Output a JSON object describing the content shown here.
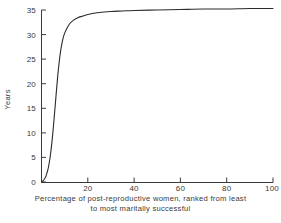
{
  "chart_data": {
    "type": "line",
    "title": "",
    "subtitle": "",
    "xlabel": "Percentage of post-reproductive women, ranked from least to most maritally successful",
    "xlabel_line1": "Percentage of  post-reproductive women, ranked from least",
    "xlabel_line2": "to most maritally successful",
    "ylabel": "Years",
    "xlim": [
      0,
      100
    ],
    "ylim": [
      0,
      35
    ],
    "xticks": [
      20,
      40,
      60,
      80,
      100
    ],
    "xtick_labels": [
      "20",
      "40",
      "60",
      "80",
      "100"
    ],
    "yticks": [
      0,
      5,
      10,
      15,
      20,
      25,
      30,
      35
    ],
    "ytick_labels": [
      "0",
      "5",
      "10",
      "15",
      "20",
      "25",
      "30",
      "35"
    ],
    "grid": false,
    "legend": "none",
    "line_color": "#2b2b2b",
    "line_width": 1.1,
    "background": "#ffffff",
    "series": [
      {
        "name": "Years",
        "x": [
          0,
          1,
          2,
          3,
          4,
          5,
          6,
          7,
          8,
          9,
          10,
          12,
          14,
          16,
          18,
          20,
          25,
          30,
          35,
          40,
          50,
          60,
          70,
          80,
          90,
          100
        ],
        "values": [
          0.0,
          0.4,
          1.3,
          3.0,
          6.0,
          10.5,
          16.0,
          21.5,
          25.8,
          28.6,
          30.3,
          32.1,
          33.0,
          33.5,
          33.8,
          34.1,
          34.5,
          34.7,
          34.8,
          34.9,
          35.0,
          35.1,
          35.2,
          35.2,
          35.3,
          35.3
        ]
      }
    ],
    "annotations": []
  },
  "axes": {
    "x_axis_name": "x-axis",
    "y_axis_name": "y-axis"
  }
}
